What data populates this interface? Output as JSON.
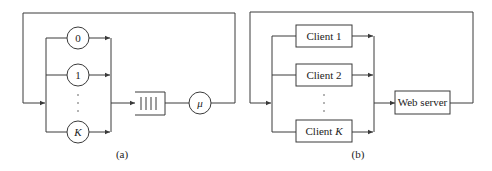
{
  "panel_a": {
    "caption": "(a)",
    "nodes": [
      {
        "id": "node-0",
        "label": "0",
        "italic": false
      },
      {
        "id": "node-1",
        "label": "1",
        "italic": false
      },
      {
        "id": "node-K",
        "label": "K",
        "italic": true
      }
    ],
    "ellipsis": "⋮",
    "queue": {
      "label": "queue"
    },
    "server": {
      "label": "μ",
      "italic": true
    }
  },
  "panel_b": {
    "caption": "(b)",
    "clients": [
      {
        "id": "client-1",
        "prefix": "Client ",
        "suffix": "1",
        "italic_suffix": false
      },
      {
        "id": "client-2",
        "prefix": "Client ",
        "suffix": "2",
        "italic_suffix": false
      },
      {
        "id": "client-K",
        "prefix": "Client ",
        "suffix": "K",
        "italic_suffix": true
      }
    ],
    "server": {
      "label": "Web server"
    }
  },
  "colors": {
    "line": "#3a3a3a",
    "text": "#222222",
    "background": "#ffffff"
  }
}
